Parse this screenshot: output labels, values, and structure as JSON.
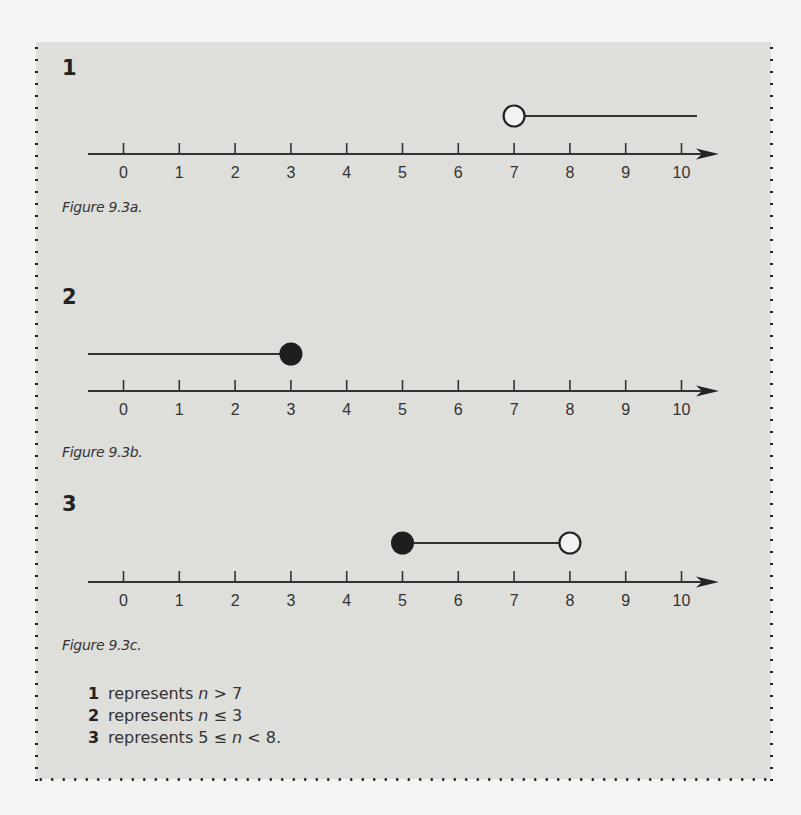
{
  "figures": [
    {
      "label": "1",
      "caption": "Figure 9.3a.",
      "ticks": [
        "0",
        "1",
        "2",
        "3",
        "4",
        "5",
        "6",
        "7",
        "8",
        "9",
        "10"
      ],
      "segment": {
        "from": 7,
        "to": "right-edge",
        "start_point": "open",
        "end_point": "none"
      }
    },
    {
      "label": "2",
      "caption": "Figure 9.3b.",
      "ticks": [
        "0",
        "1",
        "2",
        "3",
        "4",
        "5",
        "6",
        "7",
        "8",
        "9",
        "10"
      ],
      "segment": {
        "from": "left-edge",
        "to": 3,
        "start_point": "none",
        "end_point": "closed"
      }
    },
    {
      "label": "3",
      "caption": "Figure 9.3c.",
      "ticks": [
        "0",
        "1",
        "2",
        "3",
        "4",
        "5",
        "6",
        "7",
        "8",
        "9",
        "10"
      ],
      "segment": {
        "from": 5,
        "to": 8,
        "start_point": "closed",
        "end_point": "open"
      }
    }
  ],
  "summary": [
    {
      "key": "1",
      "word": "represents",
      "pre": "",
      "var": "n",
      "post": " > 7"
    },
    {
      "key": "2",
      "word": "represents",
      "pre": "",
      "var": "n",
      "post": " ≤ 3"
    },
    {
      "key": "3",
      "word": "represents",
      "pre": "5 ≤ ",
      "var": "n",
      "post": " < 8."
    }
  ],
  "chart_data": [
    {
      "type": "number-line",
      "title": "Figure 9.3a.",
      "range": [
        0,
        10
      ],
      "inequality": "n > 7",
      "endpoints": [
        {
          "value": 7,
          "style": "open"
        }
      ],
      "direction": "right"
    },
    {
      "type": "number-line",
      "title": "Figure 9.3b.",
      "range": [
        0,
        10
      ],
      "inequality": "n ≤ 3",
      "endpoints": [
        {
          "value": 3,
          "style": "closed"
        }
      ],
      "direction": "left"
    },
    {
      "type": "number-line",
      "title": "Figure 9.3c.",
      "range": [
        0,
        10
      ],
      "inequality": "5 ≤ n < 8",
      "endpoints": [
        {
          "value": 5,
          "style": "closed"
        },
        {
          "value": 8,
          "style": "open"
        }
      ],
      "direction": "between"
    }
  ]
}
